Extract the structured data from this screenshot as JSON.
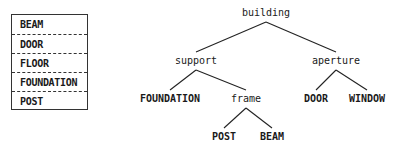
{
  "list": {
    "items": [
      "BEAM",
      "DOOR",
      "FLOOR",
      "FOUNDATION",
      "POST"
    ]
  },
  "tree": {
    "nodes": [
      {
        "id": "building",
        "label": "building",
        "leaf": false
      },
      {
        "id": "support",
        "label": "support",
        "leaf": false
      },
      {
        "id": "aperture",
        "label": "aperture",
        "leaf": false
      },
      {
        "id": "foundation",
        "label": "FOUNDATION",
        "leaf": true
      },
      {
        "id": "frame",
        "label": "frame",
        "leaf": false
      },
      {
        "id": "door",
        "label": "DOOR",
        "leaf": true
      },
      {
        "id": "window",
        "label": "WINDOW",
        "leaf": true
      },
      {
        "id": "post",
        "label": "POST",
        "leaf": true
      },
      {
        "id": "beam",
        "label": "BEAM",
        "leaf": true
      }
    ],
    "edges": [
      [
        "building",
        "support"
      ],
      [
        "building",
        "aperture"
      ],
      [
        "support",
        "foundation"
      ],
      [
        "support",
        "frame"
      ],
      [
        "aperture",
        "door"
      ],
      [
        "aperture",
        "window"
      ],
      [
        "frame",
        "post"
      ],
      [
        "frame",
        "beam"
      ]
    ]
  }
}
